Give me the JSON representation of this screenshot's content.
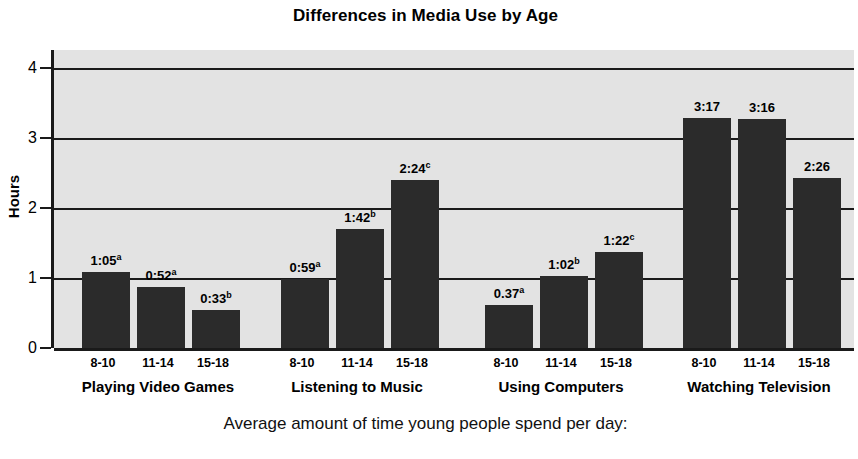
{
  "chart_data": {
    "type": "bar",
    "title": "Differences in Media Use by Age",
    "caption": "Average amount of time young people spend per day:",
    "xlabel": "",
    "ylabel": "Hours",
    "ylim": [
      0,
      4
    ],
    "yticks": [
      "0",
      "1",
      "2",
      "3",
      "4"
    ],
    "grid": true,
    "legend": "none",
    "categories": [
      "8-10",
      "11-14",
      "15-18"
    ],
    "groups": [
      {
        "label": "Playing Video Games",
        "bars": [
          {
            "age": "8-10",
            "label": "1:05",
            "superscript": "a",
            "value": 1.083
          },
          {
            "age": "11-14",
            "label": "0:52",
            "superscript": "a",
            "value": 0.867
          },
          {
            "age": "15-18",
            "label": "0:33",
            "superscript": "b",
            "value": 0.55
          }
        ]
      },
      {
        "label": "Listening to Music",
        "bars": [
          {
            "age": "8-10",
            "label": "0:59",
            "superscript": "a",
            "value": 0.983
          },
          {
            "age": "11-14",
            "label": "1:42",
            "superscript": "b",
            "value": 1.7
          },
          {
            "age": "15-18",
            "label": "2:24",
            "superscript": "c",
            "value": 2.4
          }
        ]
      },
      {
        "label": "Using Computers",
        "bars": [
          {
            "age": "8-10",
            "label": "0.37",
            "superscript": "a",
            "value": 0.617
          },
          {
            "age": "11-14",
            "label": "1:02",
            "superscript": "b",
            "value": 1.033
          },
          {
            "age": "15-18",
            "label": "1:22",
            "superscript": "c",
            "value": 1.367
          }
        ]
      },
      {
        "label": "Watching Television",
        "bars": [
          {
            "age": "8-10",
            "label": "3:17",
            "superscript": "",
            "value": 3.283
          },
          {
            "age": "11-14",
            "label": "3:16",
            "superscript": "",
            "value": 3.267
          },
          {
            "age": "15-18",
            "label": "2:26",
            "superscript": "",
            "value": 2.433
          }
        ]
      }
    ],
    "colors": {
      "bar_fill": "#2b2b2b",
      "plot_background": "#e3e3e3",
      "axis": "#1a1a1a",
      "page_background": "#ffffff",
      "text": "#000000"
    }
  }
}
